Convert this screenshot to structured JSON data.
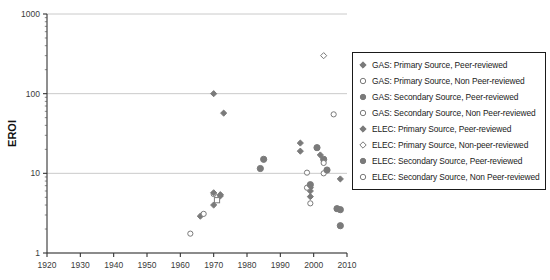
{
  "chart_data": {
    "type": "scatter",
    "title": "",
    "xlabel": "",
    "ylabel": "EROI",
    "xlim": [
      1920,
      2010
    ],
    "ylim": [
      1,
      1000
    ],
    "yscale": "log",
    "xticks": [
      1920,
      1930,
      1940,
      1950,
      1960,
      1970,
      1980,
      1990,
      2000,
      2010
    ],
    "yticks": [
      1,
      10,
      100,
      1000
    ],
    "grid": "horizontal-major",
    "legend_position": "right",
    "marker_color": "#7a7a7a",
    "series": [
      {
        "name": "GAS: Primary Source, Peer-reviewed",
        "marker": "diamond",
        "fill": "solid",
        "points": [
          [
            1970,
            100
          ],
          [
            1973,
            57
          ],
          [
            1996,
            24
          ],
          [
            1996,
            19
          ],
          [
            1966,
            2.9
          ],
          [
            1970,
            4.0
          ],
          [
            1972,
            5.2
          ],
          [
            1999,
            6.6
          ],
          [
            1999,
            6.0
          ],
          [
            1999,
            5.1
          ],
          [
            2002,
            17
          ],
          [
            2008,
            8.5
          ]
        ]
      },
      {
        "name": "GAS: Primary Source, Non Peer-reviewed",
        "marker": "circle",
        "fill": "hollow",
        "points": [
          [
            1963,
            1.75
          ],
          [
            1967,
            3.1
          ],
          [
            1970,
            5.5
          ],
          [
            1998,
            10.2
          ],
          [
            1998,
            6.6
          ],
          [
            1999,
            4.2
          ],
          [
            2003,
            10.0
          ]
        ]
      },
      {
        "name": "GAS: Secondary Source, Peer-reviewed",
        "marker": "circle",
        "fill": "solid",
        "points": [
          [
            1984,
            11.5
          ],
          [
            1985,
            15
          ],
          [
            2001,
            21
          ],
          [
            2003,
            15
          ],
          [
            2004,
            11
          ],
          [
            2007,
            3.6
          ],
          [
            2008,
            2.2
          ]
        ]
      },
      {
        "name": "GAS: Secondary Source, Non Peer-reviewed",
        "marker": "circle",
        "fill": "hollow",
        "points": [
          [
            2003,
            13.5
          ],
          [
            2006,
            55
          ]
        ]
      },
      {
        "name": "ELEC: Primary Source, Peer-reviewed",
        "marker": "diamond",
        "fill": "solid",
        "points": [
          [
            1970,
            5.7
          ],
          [
            1972,
            5.4
          ]
        ]
      },
      {
        "name": "ELEC: Primary Source, Non-peer-reviewed",
        "marker": "diamond",
        "fill": "hollow",
        "points": [
          [
            2003,
            300
          ]
        ]
      },
      {
        "name": "ELEC: Secondary Source, Peer-reviewed",
        "marker": "circle",
        "fill": "solid",
        "points": [
          [
            1999,
            7.2
          ],
          [
            2008,
            3.5
          ]
        ]
      },
      {
        "name": "ELEC: Secondary Source, Non Peer-reviewed",
        "marker": "square",
        "fill": "hollow",
        "points": [
          [
            1971,
            4.6
          ]
        ]
      }
    ]
  },
  "axes": {
    "y_title": "EROI",
    "y_tick_labels": [
      "1000",
      "100",
      "10",
      "1"
    ],
    "x_tick_labels": [
      "1920",
      "1930",
      "1940",
      "1950",
      "1960",
      "1970",
      "1980",
      "1990",
      "2000",
      "2010"
    ]
  },
  "legend": {
    "items": [
      {
        "label": "GAS: Primary Source, Peer-reviewed",
        "marker": "diamond",
        "fill": "solid"
      },
      {
        "label": "GAS: Primary Source, Non Peer-reviewed",
        "marker": "circle",
        "fill": "hollow"
      },
      {
        "label": "GAS: Secondary Source, Peer-reviewed",
        "marker": "circle",
        "fill": "solid"
      },
      {
        "label": "GAS: Secondary Source, Non Peer-reviewed",
        "marker": "circle",
        "fill": "hollow"
      },
      {
        "label": "ELEC: Primary Source, Peer-reviewed",
        "marker": "diamond",
        "fill": "solid"
      },
      {
        "label": "ELEC: Primary Source, Non-peer-reviewed",
        "marker": "diamond",
        "fill": "hollow"
      },
      {
        "label": "ELEC: Secondary Source, Peer-reviewed",
        "marker": "circle",
        "fill": "solid"
      },
      {
        "label": "ELEC: Secondary Source, Non Peer-reviewed",
        "marker": "circle",
        "fill": "hollow"
      }
    ]
  }
}
